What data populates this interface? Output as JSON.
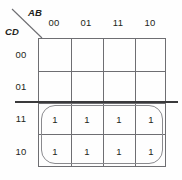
{
  "figure": {
    "type": "karnaugh-map",
    "variables_top": "AB",
    "variables_left": "CD"
  },
  "header": {
    "top_label": "AB",
    "left_label": "CD"
  },
  "columns": [
    {
      "label": "00"
    },
    {
      "label": "01"
    },
    {
      "label": "11"
    },
    {
      "label": "10"
    }
  ],
  "rows": [
    {
      "label": "00"
    },
    {
      "label": "01"
    },
    {
      "label": "11"
    },
    {
      "label": "10"
    }
  ],
  "cells": [
    {
      "row": "00",
      "col": "00",
      "value": ""
    },
    {
      "row": "00",
      "col": "01",
      "value": ""
    },
    {
      "row": "00",
      "col": "11",
      "value": ""
    },
    {
      "row": "00",
      "col": "10",
      "value": ""
    },
    {
      "row": "01",
      "col": "00",
      "value": ""
    },
    {
      "row": "01",
      "col": "01",
      "value": ""
    },
    {
      "row": "01",
      "col": "11",
      "value": ""
    },
    {
      "row": "01",
      "col": "10",
      "value": ""
    },
    {
      "row": "11",
      "col": "00",
      "value": "1"
    },
    {
      "row": "11",
      "col": "01",
      "value": "1"
    },
    {
      "row": "11",
      "col": "11",
      "value": "1"
    },
    {
      "row": "11",
      "col": "10",
      "value": "1"
    },
    {
      "row": "10",
      "col": "00",
      "value": "1"
    },
    {
      "row": "10",
      "col": "01",
      "value": "1"
    },
    {
      "row": "10",
      "col": "11",
      "value": "1"
    },
    {
      "row": "10",
      "col": "10",
      "value": "1"
    }
  ],
  "groups": [
    {
      "name": "group-bottom-two-rows",
      "covered_rows": [
        "11",
        "10"
      ],
      "covered_cols": [
        "00",
        "01",
        "11",
        "10"
      ]
    }
  ],
  "colors": {
    "grid_line": "#6e6e72",
    "text": "#231f20",
    "group_outline": "#8a8a8e",
    "scan_line": "#3a3a3c",
    "background": "#fefefe"
  }
}
